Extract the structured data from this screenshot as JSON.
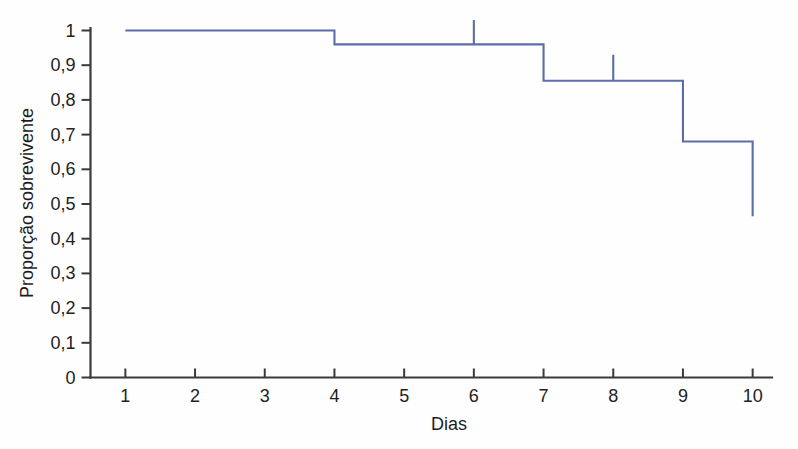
{
  "chart_data": {
    "type": "line",
    "subtype": "kaplan-meier-step",
    "title": "",
    "xlabel": "Dias",
    "ylabel": "Proporção sobrevivente",
    "xlim": [
      0.5,
      10.5
    ],
    "ylim": [
      0,
      1
    ],
    "grid": false,
    "legend": "none",
    "decimal_separator": ",",
    "x_tick_values": [
      1,
      2,
      3,
      4,
      5,
      6,
      7,
      8,
      9,
      10
    ],
    "x_tick_labels": [
      "1",
      "2",
      "3",
      "4",
      "5",
      "6",
      "7",
      "8",
      "9",
      "10"
    ],
    "y_tick_values": [
      0,
      0.1,
      0.2,
      0.3,
      0.4,
      0.5,
      0.6,
      0.7,
      0.8,
      0.9,
      1
    ],
    "y_tick_labels": [
      "0",
      "0,1",
      "0,2",
      "0,3",
      "0,4",
      "0,5",
      "0,6",
      "0,7",
      "0,8",
      "0,9",
      "1"
    ],
    "series": [
      {
        "name": "Sobrevivência",
        "color": "#5c6cab",
        "step": "post",
        "x": [
          1,
          4,
          6,
          7,
          9,
          10
        ],
        "y": [
          1.0,
          0.96,
          0.96,
          0.855,
          0.68,
          0.465
        ],
        "points": [
          {
            "x": 1,
            "y": 1.0
          },
          {
            "x": 4,
            "y": 1.0
          },
          {
            "x": 4,
            "y": 0.96
          },
          {
            "x": 7,
            "y": 0.96
          },
          {
            "x": 7,
            "y": 0.855
          },
          {
            "x": 9,
            "y": 0.855
          },
          {
            "x": 9,
            "y": 0.68
          },
          {
            "x": 10,
            "y": 0.68
          },
          {
            "x": 10,
            "y": 0.465
          }
        ],
        "censored": [
          {
            "x": 6,
            "y": 0.96,
            "top": 1.03
          },
          {
            "x": 8,
            "y": 0.855,
            "top": 0.93
          }
        ]
      }
    ]
  },
  "axes": {
    "y_axis_title": "Proporção sobrevivente",
    "x_axis_title": "Dias"
  },
  "colors": {
    "curve": "#5c6cab",
    "axis": "#3a3a3a",
    "text": "#222222",
    "background": "#fefefe"
  }
}
